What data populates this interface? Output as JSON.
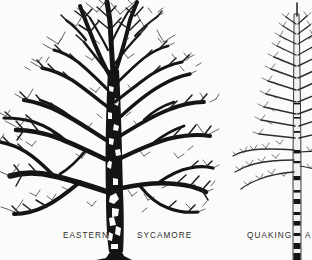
{
  "plate": {
    "title": "Winter Tree Silhouettes Identification Plate",
    "background_color": "#fbfbfa",
    "ink_color": "#141414",
    "label_color": "#2b2b2b"
  },
  "figures": [
    {
      "id": "sycamore",
      "common_name": "EASTERN SYCAMORE",
      "label_part_1": "EASTERN",
      "label_part_2": "SYCAMORE",
      "crown_form": "broad-spreading",
      "trunk_bark": "mottled-patchy",
      "cropped_edges": "left, bottom"
    },
    {
      "id": "aspen",
      "common_name": "QUAKING ASPEN",
      "label_part_1": "QUAKING",
      "label_part_2": "A",
      "crown_form": "narrow-columnar",
      "trunk_bark": "smooth-pale-with-dark-bands",
      "cropped_edges": "right, bottom"
    }
  ]
}
